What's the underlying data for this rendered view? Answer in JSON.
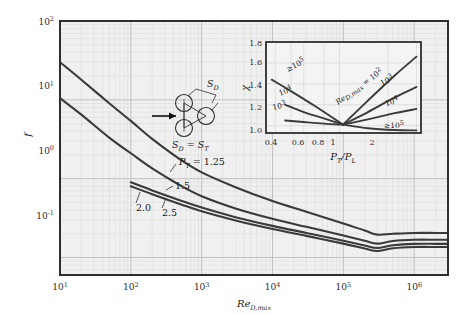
{
  "main": {
    "x_axis": {
      "label": "Re",
      "label_sub": "D,max",
      "ticks": [
        "10",
        "10",
        "10",
        "10",
        "10",
        "10"
      ],
      "exponents": [
        "1",
        "2",
        "3",
        "4",
        "5",
        "6"
      ]
    },
    "y_axis": {
      "label": "f",
      "ticks": [
        "10",
        "10",
        "10",
        "10"
      ],
      "exponents": [
        "-1",
        "0",
        "1",
        "2"
      ]
    },
    "curve_labels": [
      {
        "text": "P",
        "sub": "T",
        "eq": " = 1.25"
      },
      {
        "text": "1.5"
      },
      {
        "text": "2.0"
      },
      {
        "text": "2.5"
      }
    ],
    "schematic": {
      "sd_label": "S",
      "sd_sub": "D",
      "relation_left": "S",
      "relation_left_sub": "D",
      "relation_eq": " = ",
      "relation_right": "S",
      "relation_right_sub": "T"
    }
  },
  "inset": {
    "y_label": "χ",
    "x_label_num": "P",
    "x_label_num_sub": "T",
    "x_label_slash": "/P",
    "x_label_den_sub": "L",
    "y_ticks": [
      "1.0",
      "1.2",
      "1.4",
      "1.6",
      "1.8"
    ],
    "x_ticks": [
      "0.4",
      "0.6",
      "0.8",
      "1",
      "2"
    ],
    "left_labels": [
      "≥10",
      "10",
      "10"
    ],
    "left_exponents": [
      "5",
      "4",
      "3"
    ],
    "right_series_label": "Re",
    "right_series_sub": "D,max",
    "right_series_eq": " = 10",
    "right_series_exp": "2",
    "right_labels": [
      "10",
      "10",
      "≥10"
    ],
    "right_exponents": [
      "3",
      "4",
      "5"
    ]
  },
  "colors": {
    "plot_bg": "#f0f0f0",
    "grid_minor": "#d8d8d8",
    "grid_major": "#b9b9b9",
    "frame": "#2e2e2e",
    "curve": "#3a3a3a",
    "page_bg": "#ffffff"
  },
  "chart_data": {
    "type": "line",
    "title": "",
    "xlabel": "Re_D,max",
    "ylabel": "f",
    "xscale": "log",
    "yscale": "log",
    "xlim": [
      10,
      3000000
    ],
    "ylim": [
      0.06,
      100
    ],
    "grid": true,
    "legend": "inline curve labels",
    "series": [
      {
        "name": "P_T = 1.25",
        "x": [
          10,
          20,
          50,
          100,
          200,
          500,
          1000,
          3000,
          10000,
          30000,
          100000,
          200000,
          300000,
          500000,
          1000000,
          2000000,
          3000000
        ],
        "y": [
          30,
          18,
          9.0,
          5.4,
          3.2,
          1.75,
          1.2,
          0.78,
          0.52,
          0.38,
          0.27,
          0.22,
          0.195,
          0.2,
          0.205,
          0.205,
          0.205
        ]
      },
      {
        "name": "P_T = 1.5",
        "x": [
          10,
          20,
          50,
          100,
          200,
          500,
          1000,
          3000,
          10000,
          30000,
          100000,
          200000,
          300000,
          500000,
          1000000,
          2000000,
          3000000
        ],
        "y": [
          10.5,
          6.5,
          3.3,
          2.1,
          1.35,
          0.82,
          0.6,
          0.42,
          0.31,
          0.245,
          0.19,
          0.163,
          0.15,
          0.162,
          0.168,
          0.168,
          0.168
        ]
      },
      {
        "name": "P_T = 2.0",
        "x": [
          100,
          200,
          500,
          1000,
          3000,
          10000,
          30000,
          100000,
          200000,
          300000,
          500000,
          1000000,
          2000000,
          3000000
        ],
        "y": [
          0.9,
          0.71,
          0.53,
          0.43,
          0.325,
          0.252,
          0.205,
          0.163,
          0.142,
          0.132,
          0.143,
          0.149,
          0.149,
          0.149
        ]
      },
      {
        "name": "P_T = 2.5",
        "x": [
          100,
          200,
          500,
          1000,
          3000,
          10000,
          30000,
          100000,
          200000,
          300000,
          500000,
          1000000,
          2000000,
          3000000
        ],
        "y": [
          0.8,
          0.635,
          0.475,
          0.385,
          0.295,
          0.23,
          0.188,
          0.15,
          0.13,
          0.121,
          0.131,
          0.136,
          0.136,
          0.136
        ]
      }
    ],
    "inset_chart": {
      "type": "line",
      "xlabel": "P_T/P_L",
      "ylabel": "chi",
      "xscale": "log",
      "xlim": [
        0.35,
        3.2
      ],
      "ylim": [
        0.93,
        1.8
      ],
      "series": [
        {
          "name": ">=10^5 (left)",
          "x": [
            0.38,
            0.5,
            0.7,
            1.05
          ],
          "y": [
            1.44,
            1.33,
            1.19,
            1.01
          ]
        },
        {
          "name": "10^4 (left)",
          "x": [
            0.46,
            0.6,
            0.8,
            1.05
          ],
          "y": [
            1.2,
            1.13,
            1.07,
            1.01
          ]
        },
        {
          "name": "10^3 (left)",
          "x": [
            0.46,
            0.6,
            0.8,
            1.05
          ],
          "y": [
            1.05,
            1.035,
            1.02,
            1.01
          ]
        },
        {
          "name": "10^2 (right)",
          "x": [
            1.05,
            1.5,
            2.2,
            3.0
          ],
          "y": [
            1.01,
            1.24,
            1.48,
            1.66
          ]
        },
        {
          "name": "10^3 (right)",
          "x": [
            1.05,
            1.5,
            2.2,
            3.0
          ],
          "y": [
            1.01,
            1.13,
            1.27,
            1.37
          ]
        },
        {
          "name": "10^4 (right)",
          "x": [
            1.05,
            1.5,
            2.2,
            3.0
          ],
          "y": [
            1.01,
            1.06,
            1.12,
            1.16
          ]
        },
        {
          "name": ">=10^5 (right)",
          "x": [
            1.05,
            1.5,
            2.2,
            3.0
          ],
          "y": [
            1.01,
            0.975,
            0.958,
            0.955
          ]
        }
      ]
    }
  }
}
